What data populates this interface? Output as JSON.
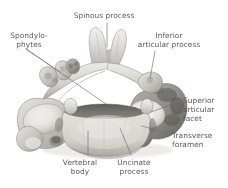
{
  "figure": {
    "background_color": "#ffffff",
    "label_color": "#58585a",
    "leader_color": "#6e6e70"
  },
  "labels": {
    "spinous_process": "Spinous process",
    "spondylophytes": "Spondylo-\nphytes",
    "inferior_articular_process": "Inferior\narticular process",
    "superior_articular_facet": "Superior\narticular\nfacet",
    "transverse_foramen": "Transverse\nforamen",
    "vertebral_body": "Vertebral\nbody",
    "uncinate_process": "Uncinate\nprocess"
  }
}
